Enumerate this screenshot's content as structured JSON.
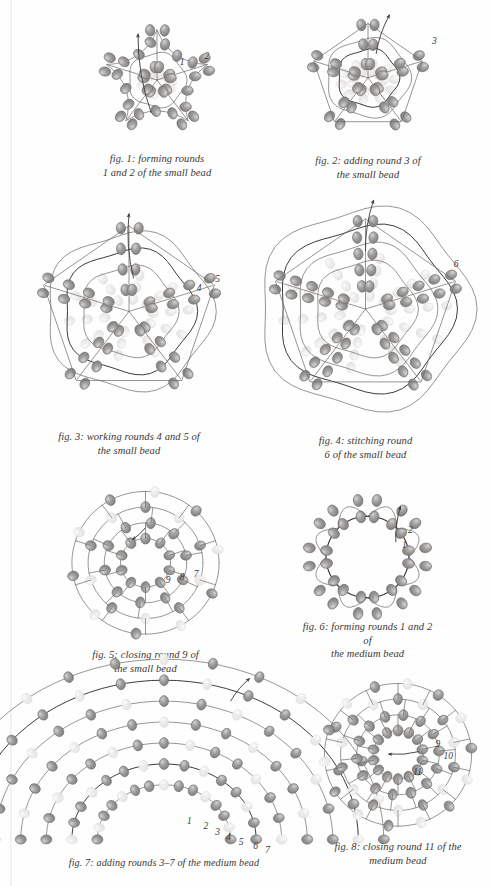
{
  "page": {
    "width": 492,
    "height": 886,
    "background": "#fefefe",
    "ink": "#3a3734",
    "bead_fill": "#8e8c8a",
    "bead_fill_light": "#b9b7b5",
    "bead_ghost": "#e8e6e4",
    "thread": "#6b6967",
    "thread_dark": "#333130"
  },
  "figures": [
    {
      "id": "fig-1",
      "number": "1",
      "caption": "fig. 1: forming rounds\n1 and 2 of the small bead",
      "style": "star5-open",
      "rings": 1,
      "points": 5,
      "labels": [
        {
          "text": "1",
          "x": 0.62,
          "y": 0.3
        },
        {
          "text": "2",
          "x": 0.75,
          "y": 0.255
        }
      ],
      "arrow": {
        "from": [
          0.47,
          0.72
        ],
        "to": [
          0.4,
          0.12
        ]
      },
      "frame": {
        "left": 62,
        "top": 18,
        "width": 190,
        "height": 132
      }
    },
    {
      "id": "fig-2",
      "number": "2",
      "caption": "fig. 2: adding round 3 of\nthe small bead",
      "style": "star5-closed",
      "rings": 2,
      "points": 5,
      "labels": [
        {
          "text": "3",
          "x": 0.855,
          "y": 0.175
        }
      ],
      "arrow": {
        "from": [
          0.545,
          0.3
        ],
        "to": [
          0.62,
          0.02
        ]
      },
      "frame": {
        "left": 278,
        "top": 12,
        "width": 180,
        "height": 140
      }
    },
    {
      "id": "fig-3",
      "number": "3",
      "caption": "fig. 3: working rounds 4 and 5 of\nthe small bead",
      "style": "star5-rings",
      "rings": 3,
      "points": 5,
      "labels": [
        {
          "text": "4",
          "x": 0.795,
          "y": 0.345
        },
        {
          "text": "5",
          "x": 0.875,
          "y": 0.305
        }
      ],
      "arrow": {
        "from": [
          0.52,
          0.32
        ],
        "to": [
          0.5,
          0.025
        ]
      },
      "frame": {
        "left": 14,
        "top": 208,
        "width": 230,
        "height": 220
      }
    },
    {
      "id": "fig-4",
      "number": "4",
      "caption": "fig. 4: stitching round\n6 of the small bead",
      "style": "star5-rings",
      "rings": 4,
      "points": 5,
      "labels": [
        {
          "text": "6",
          "x": 0.875,
          "y": 0.26
        }
      ],
      "arrow": {
        "from": [
          0.5,
          0.22
        ],
        "to": [
          0.535,
          0.0
        ]
      },
      "frame": {
        "left": 248,
        "top": 200,
        "width": 235,
        "height": 232
      }
    },
    {
      "id": "fig-5",
      "number": "5",
      "caption": "fig. 5: closing round 9 of\nthe small bead",
      "style": "concentric",
      "rings": 4,
      "points": 5,
      "labels": [
        {
          "text": "9",
          "x": 0.615,
          "y": 0.565
        },
        {
          "text": "8",
          "x": 0.695,
          "y": 0.545
        },
        {
          "text": "7",
          "x": 0.775,
          "y": 0.525
        }
      ],
      "arrow": {
        "from": [
          0.5,
          0.26
        ],
        "to": [
          0.425,
          0.335
        ]
      },
      "frame": {
        "left": 58,
        "top": 486,
        "width": 175,
        "height": 160
      }
    },
    {
      "id": "fig-6",
      "number": "6",
      "caption": "fig. 6: forming rounds 1 and 2 of\nthe medium bead",
      "style": "ring-flower",
      "rings": 1,
      "points": 8,
      "labels": [
        {
          "text": "2",
          "x": 0.8,
          "y": 0.245
        },
        {
          "text": "1",
          "x": 0.755,
          "y": 0.37
        }
      ],
      "arrow": {
        "from": [
          0.71,
          0.38
        ],
        "to": [
          0.745,
          0.085
        ]
      },
      "frame": {
        "left": 300,
        "top": 496,
        "width": 135,
        "height": 122
      }
    },
    {
      "id": "fig-7",
      "number": "7",
      "caption": "fig. 7: adding rounds 3–7 of the medium bead",
      "style": "arch",
      "rings": 5,
      "points": 7,
      "labels": [
        {
          "text": "1",
          "x": 0.585,
          "y": 0.795
        },
        {
          "text": "2",
          "x": 0.645,
          "y": 0.825
        },
        {
          "text": "3",
          "x": 0.688,
          "y": 0.855
        },
        {
          "text": "4",
          "x": 0.728,
          "y": 0.885
        },
        {
          "text": "5",
          "x": 0.775,
          "y": 0.91
        },
        {
          "text": "6",
          "x": 0.828,
          "y": 0.935
        },
        {
          "text": "7",
          "x": 0.872,
          "y": 0.955
        }
      ],
      "arrow": {
        "from": [
          0.745,
          0.16
        ],
        "to": [
          0.815,
          0.035
        ]
      },
      "frame": {
        "left": 28,
        "top": 672,
        "width": 272,
        "height": 182
      }
    },
    {
      "id": "fig-8",
      "number": "8",
      "caption": "fig. 8: closing round 11 of the\nmedium bead",
      "style": "concentric",
      "rings": 4,
      "points": 7,
      "labels": [
        {
          "text": "9",
          "x": 0.735,
          "y": 0.385
        },
        {
          "text": "10",
          "x": 0.785,
          "y": 0.465
        },
        {
          "text": "11",
          "x": 0.595,
          "y": 0.565
        }
      ],
      "arrow": {
        "from": [
          0.63,
          0.46
        ],
        "to": [
          0.44,
          0.475
        ]
      },
      "frame": {
        "left": 318,
        "top": 678,
        "width": 160,
        "height": 160
      }
    }
  ]
}
